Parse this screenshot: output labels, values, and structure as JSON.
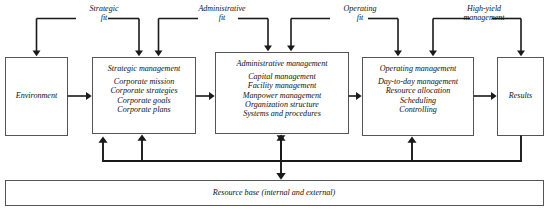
{
  "diagram": {
    "top_labels": [
      {
        "id": "strategic-fit",
        "line1": "Strategic",
        "line2": "fit"
      },
      {
        "id": "administrative-fit",
        "line1": "Administrative",
        "line2": "fit"
      },
      {
        "id": "operating-fit",
        "line1": "Operating",
        "line2": "fit"
      },
      {
        "id": "high-yield-management",
        "line1": "High-yield",
        "line2": "management"
      }
    ],
    "boxes": [
      {
        "id": "environment",
        "title": "Environment",
        "items": []
      },
      {
        "id": "strategic-management",
        "title": "Strategic management",
        "items": [
          "Corporate mission",
          "Corporate strategies",
          "Corporate goals",
          "Corporate plans"
        ]
      },
      {
        "id": "administrative-management",
        "title": "Administrative management",
        "items": [
          "Capital management",
          "Facility management",
          "Manpower management",
          "Organization structure",
          "Systems and procedures"
        ]
      },
      {
        "id": "operating-management",
        "title": "Operating management",
        "items": [
          "Day-to-day management",
          "Resource allocation",
          "Scheduling",
          "Controlling"
        ]
      },
      {
        "id": "results",
        "title": "Results",
        "items": []
      }
    ],
    "resource_base": {
      "id": "resource-base",
      "label": "Resource base (internal and external)"
    },
    "colors": {
      "box_stroke": "#555555",
      "line": "#1a1a1a",
      "background": "#ffffff",
      "text": "#111111"
    }
  }
}
